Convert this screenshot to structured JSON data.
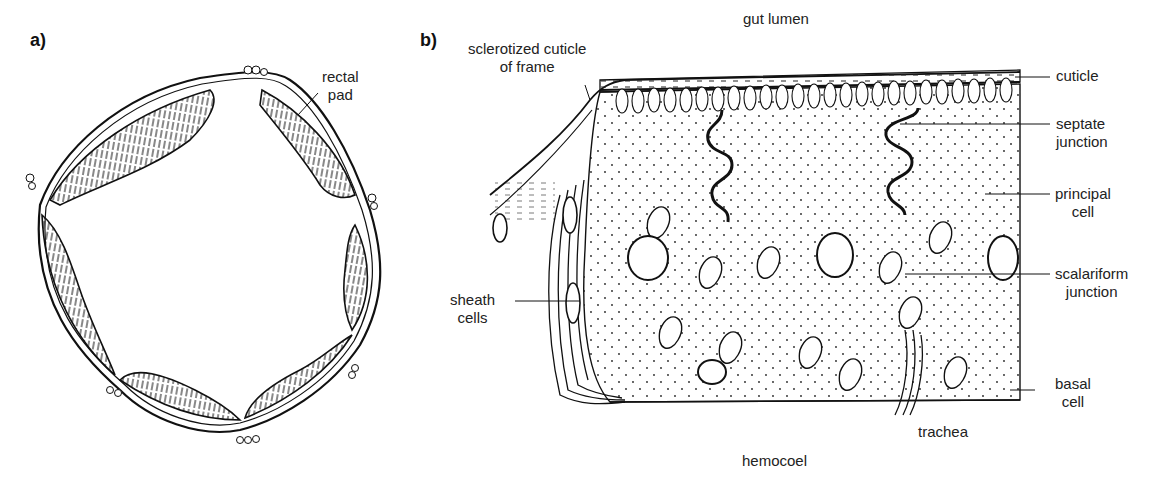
{
  "figure": {
    "panels": [
      {
        "id": "a",
        "tag": "a)",
        "title": "Cross-section of rectum showing six rectal pads",
        "labels": {
          "rectal_pad": [
            "rectal",
            "pad"
          ]
        }
      },
      {
        "id": "b",
        "tag": "b)",
        "title": "Section through a rectal pad",
        "labels": {
          "gut_lumen": "gut lumen",
          "hemocoel": "hemocoel",
          "sclerotized_cuticle": [
            "sclerotized cuticle",
            "of frame"
          ],
          "cuticle": "cuticle",
          "septate_junction": [
            "septate",
            "junction"
          ],
          "principal_cell": [
            "principal",
            "cell"
          ],
          "scalariform_junction": [
            "scalariform",
            "junction"
          ],
          "basal_cell": [
            "basal",
            "cell"
          ],
          "trachea": "trachea",
          "sheath_cells": [
            "sheath",
            "cells"
          ]
        }
      }
    ],
    "colors": {
      "ink": "#111111",
      "background": "#ffffff"
    }
  }
}
